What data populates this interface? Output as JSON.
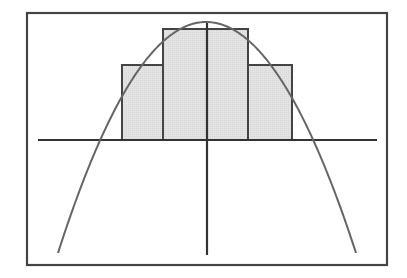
{
  "diagram": {
    "type": "riemann-sum-under-parabola",
    "colors": {
      "background": "#ffffff",
      "frame": "#444444",
      "axis": "#333333",
      "bar_fill": "#e0e0e0",
      "bar_stroke": "#444444",
      "curve": "#666666"
    },
    "frame": {
      "x": 27,
      "y": 13,
      "width": 360,
      "height": 252
    },
    "x_axis": {
      "x1": 38,
      "x2": 377,
      "y": 140
    },
    "y_axis": {
      "x": 207,
      "y1": 23,
      "y2": 255
    },
    "bars": [
      {
        "x": 122,
        "top": 65,
        "width": 41
      },
      {
        "x": 163,
        "top": 29,
        "width": 44
      },
      {
        "x": 207,
        "top": 29,
        "width": 41
      },
      {
        "x": 248,
        "top": 65,
        "width": 44
      }
    ],
    "curve": {
      "kind": "parabola",
      "vertex": {
        "x": 206,
        "y": 22
      },
      "left_end": {
        "x": 58,
        "y": 253
      },
      "right_end": {
        "x": 356,
        "y": 253
      },
      "x_intercepts": [
        98,
        313
      ]
    }
  }
}
